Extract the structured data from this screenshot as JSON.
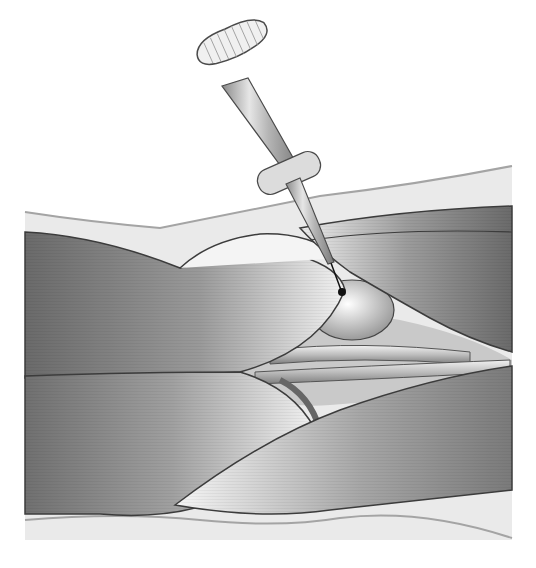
{
  "illustration": {
    "subject": "needle-insertion-between-muscles",
    "palette": {
      "background": "#ffffff",
      "skin": "#e8e8e8",
      "skin_edge": "#9a9a9a",
      "muscle_dark": "#6e6e6e",
      "muscle_mid": "#a8a8a8",
      "muscle_light": "#f4f4f4",
      "outline": "#3c3c3c",
      "needle_tip": "#111111"
    }
  }
}
